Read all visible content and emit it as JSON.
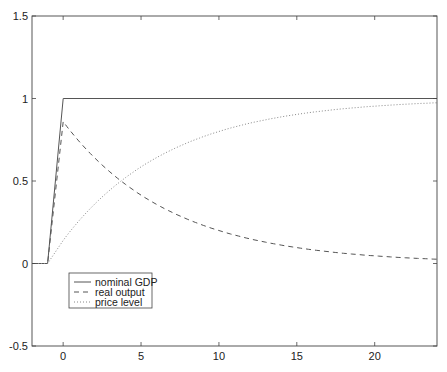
{
  "chart_data": {
    "type": "line",
    "title": "",
    "xlabel": "",
    "ylabel": "",
    "xlim": [
      -2,
      24
    ],
    "ylim": [
      -0.5,
      1.5
    ],
    "xticks": [
      0,
      5,
      10,
      15,
      20
    ],
    "yticks": [
      -0.5,
      0,
      0.5,
      1,
      1.5
    ],
    "xtick_labels": [
      "0",
      "5",
      "10",
      "15",
      "20"
    ],
    "ytick_labels": [
      "-0.5",
      "0",
      "0.5",
      "1",
      "1.5"
    ],
    "grid": false,
    "legend_position": "lower left",
    "series": [
      {
        "name": "nominal GDP",
        "style": "solid",
        "x": [
          -2,
          -1,
          0,
          24
        ],
        "y": [
          0,
          0,
          1,
          1
        ]
      },
      {
        "name": "real output",
        "style": "dashed",
        "x": [
          -2,
          -1,
          0,
          2,
          4,
          6,
          8,
          10,
          12,
          14,
          16,
          18,
          20,
          22,
          24
        ],
        "y": [
          0,
          0,
          0.86,
          0.64,
          0.48,
          0.36,
          0.27,
          0.2,
          0.15,
          0.11,
          0.083,
          0.062,
          0.046,
          0.035,
          0.026
        ]
      },
      {
        "name": "price level",
        "style": "dotted",
        "x": [
          -2,
          -1,
          0,
          2,
          4,
          6,
          8,
          10,
          12,
          14,
          16,
          18,
          20,
          22,
          24
        ],
        "y": [
          0,
          0,
          0.14,
          0.36,
          0.52,
          0.64,
          0.73,
          0.8,
          0.85,
          0.89,
          0.917,
          0.938,
          0.954,
          0.965,
          0.974
        ]
      }
    ]
  },
  "legend": {
    "items": [
      "nominal GDP",
      "real output",
      "price level"
    ]
  }
}
